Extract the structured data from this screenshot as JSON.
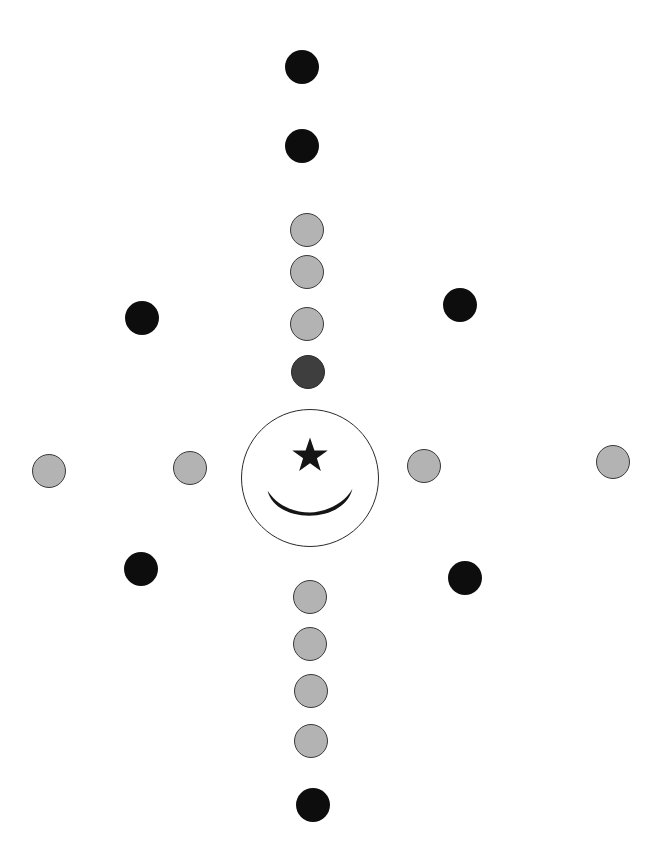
{
  "diagram": {
    "colors": {
      "background": "#ffffff",
      "black_dot": "#0d0d0d",
      "gray_dot": "#b3b3b3",
      "gray_dot_border": "#3a3a3a",
      "dark_gray_dot": "#3e3e3e",
      "emblem_stroke": "#2a2a2a",
      "emblem_symbol": "#151515"
    },
    "dot_radius": 17,
    "emblem": {
      "cx": 310,
      "cy": 478,
      "r": 69,
      "symbols": [
        "star-icon",
        "crescent-icon"
      ]
    },
    "dots": [
      {
        "id": "top-1",
        "x": 302,
        "y": 67,
        "type": "black"
      },
      {
        "id": "top-2",
        "x": 302,
        "y": 146,
        "type": "black"
      },
      {
        "id": "top-3",
        "x": 307,
        "y": 230,
        "type": "gray"
      },
      {
        "id": "top-4",
        "x": 307,
        "y": 272,
        "type": "gray"
      },
      {
        "id": "top-5",
        "x": 307,
        "y": 324,
        "type": "gray"
      },
      {
        "id": "top-6",
        "x": 308,
        "y": 372,
        "type": "darkgray"
      },
      {
        "id": "upper-left",
        "x": 142,
        "y": 318,
        "type": "black"
      },
      {
        "id": "upper-right",
        "x": 460,
        "y": 305,
        "type": "black"
      },
      {
        "id": "far-left",
        "x": 49,
        "y": 471,
        "type": "gray"
      },
      {
        "id": "near-left",
        "x": 190,
        "y": 468,
        "type": "gray"
      },
      {
        "id": "near-right",
        "x": 424,
        "y": 466,
        "type": "gray"
      },
      {
        "id": "far-right",
        "x": 613,
        "y": 462,
        "type": "gray"
      },
      {
        "id": "lower-left",
        "x": 141,
        "y": 569,
        "type": "black"
      },
      {
        "id": "lower-right",
        "x": 465,
        "y": 578,
        "type": "black"
      },
      {
        "id": "bottom-1",
        "x": 310,
        "y": 597,
        "type": "gray"
      },
      {
        "id": "bottom-2",
        "x": 310,
        "y": 644,
        "type": "gray"
      },
      {
        "id": "bottom-3",
        "x": 311,
        "y": 691,
        "type": "gray"
      },
      {
        "id": "bottom-4",
        "x": 311,
        "y": 741,
        "type": "gray"
      },
      {
        "id": "bottom-5",
        "x": 313,
        "y": 805,
        "type": "black"
      }
    ]
  }
}
